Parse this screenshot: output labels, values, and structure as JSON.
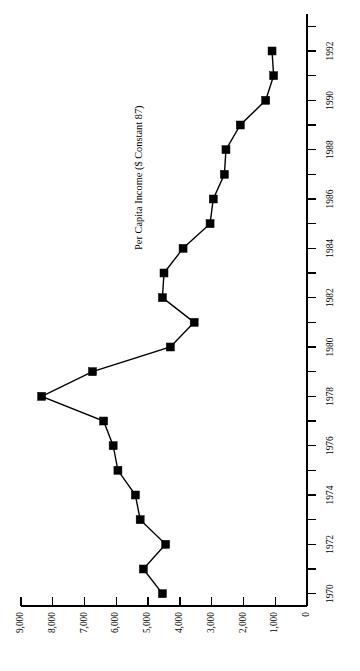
{
  "chart_data": {
    "type": "line",
    "title": "Per Capita Income ($ Constant 87)",
    "orientation": "rotated-90-ccw",
    "xlabel": "",
    "ylabel": "Per Capita Income ($ Constant 87)",
    "grid": false,
    "legend": null,
    "xlim": [
      1969.5,
      1993.5
    ],
    "ylim": [
      0,
      9400
    ],
    "x": [
      1970,
      1971,
      1972,
      1973,
      1974,
      1975,
      1976,
      1977,
      1978,
      1979,
      1980,
      1981,
      1982,
      1983,
      1984,
      1985,
      1986,
      1987,
      1988,
      1989,
      1990,
      1991,
      1992
    ],
    "values": [
      4550,
      5150,
      4450,
      5250,
      5400,
      5950,
      6100,
      6400,
      8350,
      6750,
      4300,
      3550,
      4550,
      4500,
      3900,
      3050,
      2950,
      2600,
      2550,
      2100,
      1300,
      1050,
      1100
    ],
    "categories": [
      "1970",
      "1971",
      "1972",
      "1973",
      "1974",
      "1975",
      "1976",
      "1977",
      "1978",
      "1979",
      "1980",
      "1981",
      "1982",
      "1983",
      "1984",
      "1985",
      "1986",
      "1987",
      "1988",
      "1989",
      "1990",
      "1991",
      "1992"
    ],
    "value_axis_ticks": [
      {
        "value": 9000,
        "label": "9,000"
      },
      {
        "value": 8000,
        "label": "8,000"
      },
      {
        "value": 7000,
        "label": "7,000"
      },
      {
        "value": 6000,
        "label": "6,000"
      },
      {
        "value": 5000,
        "label": "5,000"
      },
      {
        "value": 4000,
        "label": "4,000"
      },
      {
        "value": 3000,
        "label": "3,000"
      },
      {
        "value": 2000,
        "label": "2,000"
      },
      {
        "value": 1000,
        "label": "1,000"
      },
      {
        "value": 0,
        "label": "0"
      }
    ],
    "year_axis_ticks": [
      {
        "value": 1970,
        "label": "1970"
      },
      {
        "value": 1971,
        "label": ""
      },
      {
        "value": 1972,
        "label": "1972"
      },
      {
        "value": 1973,
        "label": ""
      },
      {
        "value": 1974,
        "label": "1974"
      },
      {
        "value": 1975,
        "label": ""
      },
      {
        "value": 1976,
        "label": "1976"
      },
      {
        "value": 1977,
        "label": ""
      },
      {
        "value": 1978,
        "label": "1978"
      },
      {
        "value": 1979,
        "label": ""
      },
      {
        "value": 1980,
        "label": "1980"
      },
      {
        "value": 1981,
        "label": ""
      },
      {
        "value": 1982,
        "label": "1982"
      },
      {
        "value": 1983,
        "label": ""
      },
      {
        "value": 1984,
        "label": "1984"
      },
      {
        "value": 1985,
        "label": ""
      },
      {
        "value": 1986,
        "label": "1986"
      },
      {
        "value": 1987,
        "label": ""
      },
      {
        "value": 1988,
        "label": "1988"
      },
      {
        "value": 1989,
        "label": ""
      },
      {
        "value": 1990,
        "label": "1990"
      },
      {
        "value": 1991,
        "label": ""
      },
      {
        "value": 1992,
        "label": "1992"
      },
      {
        "value": 1993,
        "label": ""
      }
    ],
    "colors": {
      "line": "#000000",
      "marker": "#000000",
      "axis": "#000000",
      "background": "#ffffff",
      "text": "#000000"
    }
  }
}
